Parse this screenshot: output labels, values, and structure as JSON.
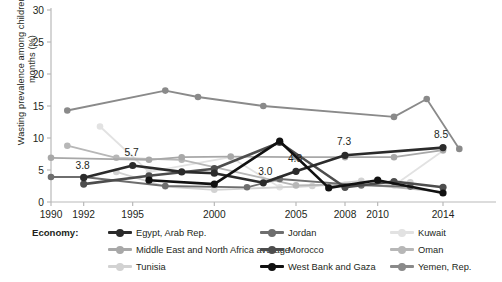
{
  "chart_data": {
    "type": "line",
    "title": "",
    "xlabel": "",
    "ylabel": "Wasting prevalence among children 0–59 months (%)",
    "ylim": [
      0,
      30
    ],
    "yticks": [
      0,
      5,
      10,
      15,
      20,
      25,
      30
    ],
    "xlim": [
      1990,
      2015
    ],
    "xticks": [
      1990,
      1992,
      1995,
      2000,
      2005,
      2008,
      2010,
      2014
    ],
    "xticklabels": [
      "1990",
      "1992",
      "1995",
      "2000",
      "2005",
      "2008",
      "2010",
      "2014"
    ],
    "grid": false,
    "legend_position": "bottom",
    "legend_title": "Economy:",
    "annotations": [
      {
        "text": "3.8",
        "x": 1992,
        "y": 3.8
      },
      {
        "text": "5.7",
        "x": 1995,
        "y": 5.7
      },
      {
        "text": "3.0",
        "x": 2003,
        "y": 3.0
      },
      {
        "text": "4.8",
        "x": 2005,
        "y": 4.8
      },
      {
        "text": "7.3",
        "x": 2008,
        "y": 7.3
      },
      {
        "text": "8.5",
        "x": 2014,
        "y": 8.5
      }
    ],
    "series": [
      {
        "name": "Egypt, Arab Rep.",
        "color": "#2b2b2b",
        "points": [
          [
            1992,
            3.8
          ],
          [
            1995,
            5.7
          ],
          [
            1998,
            4.7
          ],
          [
            2000,
            4.5
          ],
          [
            2003,
            3.0
          ],
          [
            2005,
            4.8
          ],
          [
            2008,
            7.3
          ],
          [
            2014,
            8.5
          ]
        ]
      },
      {
        "name": "Middle East and North Africa average",
        "color": "#a8a8a8",
        "points": [
          [
            1990,
            6.9
          ],
          [
            1996,
            6.6
          ],
          [
            1998,
            7.0
          ],
          [
            2001,
            7.1
          ],
          [
            2005,
            7.0
          ],
          [
            2008,
            7.0
          ],
          [
            2011,
            7.0
          ],
          [
            2014,
            8.1
          ]
        ]
      },
      {
        "name": "Tunisia",
        "color": "#d2d2d2",
        "points": [
          [
            1994,
            4.7
          ],
          [
            1997,
            2.4
          ],
          [
            2000,
            1.9
          ],
          [
            2006,
            2.5
          ],
          [
            2009,
            3.3
          ],
          [
            2011,
            2.7
          ],
          [
            2012,
            3.1
          ]
        ]
      },
      {
        "name": "Jordan",
        "color": "#6e6e6e",
        "points": [
          [
            1990,
            3.9
          ],
          [
            1992,
            3.9
          ],
          [
            1997,
            2.5
          ],
          [
            2002,
            2.3
          ],
          [
            2004,
            3.6
          ],
          [
            2009,
            2.6
          ],
          [
            2012,
            2.4
          ]
        ]
      },
      {
        "name": "Morocco",
        "color": "#4d4d4d",
        "points": [
          [
            1992,
            2.8
          ],
          [
            1996,
            4.1
          ],
          [
            2000,
            5.2
          ],
          [
            2004,
            9.3
          ],
          [
            2008,
            2.3
          ],
          [
            2011,
            3.2
          ],
          [
            2014,
            2.3
          ]
        ]
      },
      {
        "name": "West Bank and Gaza",
        "color": "#111111",
        "points": [
          [
            1996,
            3.4
          ],
          [
            2000,
            2.8
          ],
          [
            2004,
            9.5
          ],
          [
            2007,
            2.2
          ],
          [
            2010,
            3.4
          ],
          [
            2014,
            1.4
          ]
        ]
      },
      {
        "name": "Kuwait",
        "color": "#e2e2e2",
        "points": [
          [
            1993,
            11.8
          ],
          [
            1996,
            4.7
          ],
          [
            2001,
            7.0
          ],
          [
            2004,
            2.3
          ],
          [
            2008,
            2.7
          ],
          [
            2011,
            2.6
          ],
          [
            2014,
            8.0
          ]
        ]
      },
      {
        "name": "Oman",
        "color": "#b7b7b7",
        "points": [
          [
            1991,
            8.8
          ],
          [
            1994,
            6.9
          ],
          [
            1998,
            6.6
          ],
          [
            2005,
            2.6
          ],
          [
            2009,
            2.8
          ],
          [
            2014,
            1.6
          ]
        ]
      },
      {
        "name": "Yemen, Rep.",
        "color": "#8a8a8a",
        "points": [
          [
            1991,
            14.3
          ],
          [
            1997,
            17.4
          ],
          [
            1999,
            16.4
          ],
          [
            2003,
            15.0
          ],
          [
            2011,
            13.3
          ],
          [
            2013,
            16.1
          ],
          [
            2015,
            8.3
          ]
        ]
      }
    ]
  },
  "legend": {
    "title": "Economy:",
    "items": [
      {
        "label": "Egypt, Arab Rep.",
        "color": "#2b2b2b",
        "col": 0,
        "row": 0
      },
      {
        "label": "Middle East and North Africa average",
        "color": "#a8a8a8",
        "col": 0,
        "row": 1
      },
      {
        "label": "Tunisia",
        "color": "#d2d2d2",
        "col": 0,
        "row": 2
      },
      {
        "label": "Jordan",
        "color": "#6e6e6e",
        "col": 1,
        "row": 0
      },
      {
        "label": "Morocco",
        "color": "#4d4d4d",
        "col": 1,
        "row": 1
      },
      {
        "label": "West Bank and Gaza",
        "color": "#111111",
        "col": 1,
        "row": 2
      },
      {
        "label": "Kuwait",
        "color": "#e2e2e2",
        "col": 2,
        "row": 0
      },
      {
        "label": "Oman",
        "color": "#b7b7b7",
        "col": 2,
        "row": 1
      },
      {
        "label": "Yemen, Rep.",
        "color": "#8a8a8a",
        "col": 2,
        "row": 2
      }
    ]
  },
  "axis": {
    "y_title": "Wasting prevalence among children 0–59 months (%)",
    "axis_color": "#b9b9b9",
    "tick_text_color": "#231f20"
  }
}
